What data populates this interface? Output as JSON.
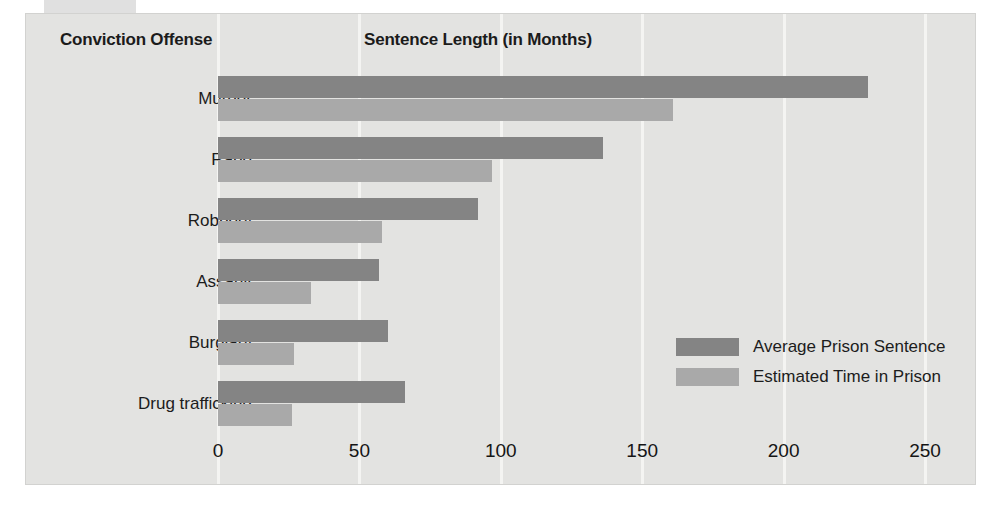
{
  "artifact": {
    "text": ""
  },
  "header": {
    "category_column": "Conviction Offense",
    "value_column": "Sentence Length (in Months)"
  },
  "legend": {
    "items": [
      {
        "label": "Average Prison Sentence",
        "color": "#848484"
      },
      {
        "label": "Estimated Time in Prison",
        "color": "#a9a9a9"
      }
    ]
  },
  "axis": {
    "ticks": [
      "0",
      "50",
      "100",
      "150",
      "200",
      "250"
    ]
  },
  "chart_data": {
    "type": "bar",
    "orientation": "horizontal",
    "title": "Sentence Length (in Months)",
    "xlabel": "Sentence Length (in Months)",
    "ylabel": "Conviction Offense",
    "xlim": [
      0,
      250
    ],
    "xticks": [
      0,
      50,
      100,
      150,
      200,
      250
    ],
    "grid": true,
    "legend_position": "inside-right",
    "categories": [
      "Murder",
      "Rape",
      "Robbery",
      "Assault",
      "Burglary",
      "Drug trafficking"
    ],
    "series": [
      {
        "name": "Average Prison Sentence",
        "color": "#848484",
        "values": [
          230,
          136,
          92,
          57,
          60,
          66
        ]
      },
      {
        "name": "Estimated Time in Prison",
        "color": "#a9a9a9",
        "values": [
          161,
          97,
          58,
          33,
          27,
          26
        ]
      }
    ]
  },
  "colors": {
    "panel_background": "#e3e3e1",
    "gridline": "#f4f4f2",
    "dark_bar": "#848484",
    "light_bar": "#a9a9a9",
    "text": "#1c1c1c"
  }
}
